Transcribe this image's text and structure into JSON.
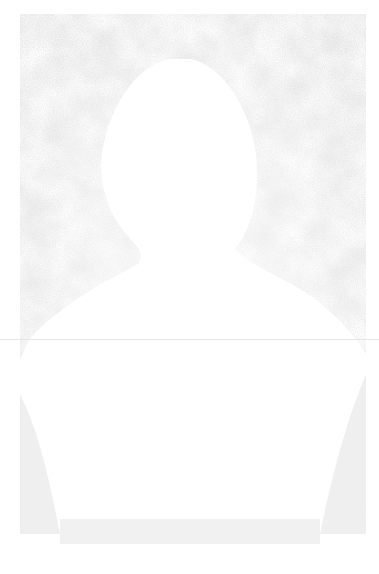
{
  "image": {
    "description": "Faded, grainy scan of a head-and-shoulders portrait silhouette against a speckled gray background",
    "subject": "bust silhouette",
    "colors": {
      "background": "#ffffff",
      "speckle_dark": "#b8b8b8",
      "speckle_light": "#e2e2e2",
      "figure": "#ffffff",
      "rule_line": "#e6e6e6"
    }
  }
}
